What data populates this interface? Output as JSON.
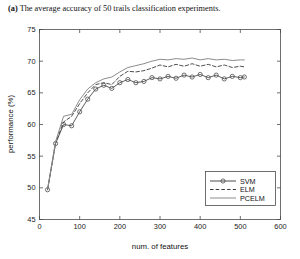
{
  "caption": {
    "label": "(a)",
    "text": "The average accuracy of 50 trails classification experiments."
  },
  "chart_data": {
    "type": "line",
    "title": "",
    "xlabel": "num. of features",
    "ylabel": "performance (%)",
    "xlim": [
      0,
      600
    ],
    "ylim": [
      45,
      75
    ],
    "xticks": [
      0,
      100,
      200,
      300,
      400,
      500,
      600
    ],
    "yticks": [
      45,
      50,
      55,
      60,
      65,
      70,
      75
    ],
    "grid": false,
    "legend_position": "lower right",
    "legend_entries": [
      "SVM",
      "ELM",
      "PCELM"
    ],
    "x": [
      20,
      40,
      60,
      80,
      100,
      120,
      140,
      160,
      180,
      200,
      220,
      240,
      260,
      280,
      300,
      320,
      340,
      360,
      380,
      400,
      420,
      440,
      460,
      480,
      500,
      510
    ],
    "series": [
      {
        "name": "SVM",
        "style": "solid-with-circle-markers",
        "color": "#4d4d4d",
        "marker": "circle",
        "values": [
          49.7,
          57.0,
          60.0,
          59.8,
          62.0,
          64.0,
          65.6,
          66.2,
          65.7,
          66.6,
          67.1,
          66.6,
          66.8,
          67.4,
          67.2,
          67.6,
          67.3,
          67.8,
          67.5,
          67.9,
          67.4,
          67.8,
          67.2,
          67.6,
          67.4,
          67.5
        ]
      },
      {
        "name": "ELM",
        "style": "dashed",
        "color": "#3a3a3a",
        "marker": "none",
        "values": [
          49.7,
          57.1,
          60.4,
          61.3,
          63.3,
          65.0,
          66.3,
          66.6,
          66.3,
          67.6,
          68.4,
          68.3,
          68.5,
          68.9,
          69.4,
          69.1,
          69.5,
          69.2,
          69.6,
          69.2,
          69.5,
          69.1,
          69.4,
          69.0,
          69.2,
          69.1
        ]
      },
      {
        "name": "PCELM",
        "style": "solid",
        "color": "#8c8c8c",
        "marker": "none",
        "values": [
          49.8,
          57.3,
          61.3,
          61.6,
          63.9,
          65.6,
          66.6,
          67.2,
          67.5,
          68.3,
          69.0,
          69.3,
          69.6,
          70.0,
          70.3,
          70.2,
          70.4,
          70.3,
          70.5,
          70.2,
          70.4,
          70.2,
          70.3,
          70.1,
          70.2,
          70.2
        ]
      }
    ]
  }
}
